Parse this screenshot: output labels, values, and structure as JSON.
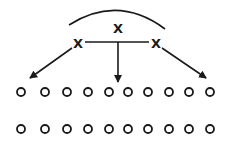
{
  "diagram": {
    "nodes": {
      "top": {
        "label": "X",
        "x": 118,
        "y": 28
      },
      "left": {
        "label": "X",
        "x": 78,
        "y": 43
      },
      "right": {
        "label": "X",
        "x": 156,
        "y": 43
      }
    },
    "arc": {
      "from": [
        69,
        25
      ],
      "control": [
        118,
        -6
      ],
      "to": [
        165,
        29
      ]
    },
    "connector": {
      "from": [
        85,
        42
      ],
      "to": [
        149,
        42
      ]
    },
    "arrows": [
      {
        "from": [
          72,
          48
        ],
        "to": [
          30,
          78
        ]
      },
      {
        "from": [
          118,
          42
        ],
        "to": [
          118,
          82
        ]
      },
      {
        "from": [
          162,
          48
        ],
        "to": [
          206,
          78
        ]
      }
    ],
    "circle_rows": [
      {
        "y": 92,
        "xs": [
          21,
          45,
          67,
          88,
          109,
          128,
          148,
          169,
          189,
          210
        ]
      },
      {
        "y": 129,
        "xs": [
          21,
          45,
          67,
          88,
          109,
          128,
          148,
          169,
          189,
          210
        ]
      }
    ],
    "circle_radius": 4,
    "stroke_color": "#1a1a1a"
  }
}
